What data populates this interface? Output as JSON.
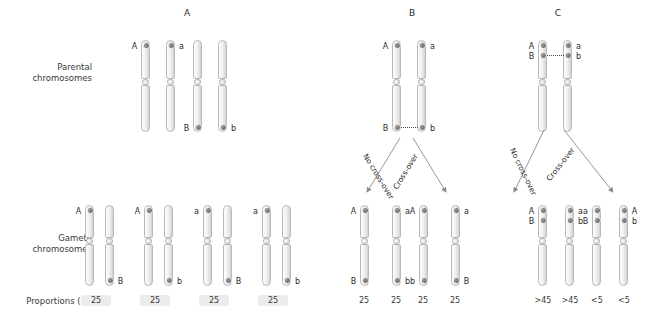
{
  "row_labels": {
    "parental_line1": "Parental",
    "parental_line2": "chromosomes",
    "gamete_line1": "Gamete",
    "gamete_line2": "chromosomes",
    "proportions": "Proportions (%)"
  },
  "arrow_labels": {
    "no_crossover": "No cross-over",
    "crossover": "Cross-over"
  },
  "panels": [
    {
      "id": "A",
      "title": "A",
      "parental": [
        {
          "top_label": "A",
          "top_side": "left",
          "bottom_label": "",
          "bottom_side": "",
          "top_dot": true,
          "bottom_dot": false
        },
        {
          "top_label": "a",
          "top_side": "right",
          "bottom_label": "",
          "bottom_side": "",
          "top_dot": true,
          "bottom_dot": false
        },
        {
          "top_label": "",
          "top_side": "",
          "bottom_label": "B",
          "bottom_side": "left",
          "top_dot": false,
          "bottom_dot": true
        },
        {
          "top_label": "",
          "top_side": "",
          "bottom_label": "b",
          "bottom_side": "right",
          "top_dot": false,
          "bottom_dot": true
        }
      ],
      "gametes": [
        {
          "proportion": "25",
          "banded": true,
          "chroms": [
            {
              "top_label": "A",
              "top_side": "left",
              "bottom_label": "",
              "bottom_side": "",
              "top_dot": true,
              "bottom_dot": false
            },
            {
              "top_label": "",
              "top_side": "",
              "bottom_label": "B",
              "bottom_side": "right",
              "top_dot": false,
              "bottom_dot": true
            }
          ]
        },
        {
          "proportion": "25",
          "banded": true,
          "chroms": [
            {
              "top_label": "A",
              "top_side": "left",
              "bottom_label": "",
              "bottom_side": "",
              "top_dot": true,
              "bottom_dot": false
            },
            {
              "top_label": "",
              "top_side": "",
              "bottom_label": "b",
              "bottom_side": "right",
              "top_dot": false,
              "bottom_dot": true
            }
          ]
        },
        {
          "proportion": "25",
          "banded": true,
          "chroms": [
            {
              "top_label": "a",
              "top_side": "left",
              "bottom_label": "",
              "bottom_side": "",
              "top_dot": true,
              "bottom_dot": false
            },
            {
              "top_label": "",
              "top_side": "",
              "bottom_label": "B",
              "bottom_side": "right",
              "top_dot": false,
              "bottom_dot": true
            }
          ]
        },
        {
          "proportion": "25",
          "banded": true,
          "chroms": [
            {
              "top_label": "a",
              "top_side": "left",
              "bottom_label": "",
              "bottom_side": "",
              "top_dot": true,
              "bottom_dot": false
            },
            {
              "top_label": "",
              "top_side": "",
              "bottom_label": "b",
              "bottom_side": "right",
              "top_dot": false,
              "bottom_dot": true
            }
          ]
        }
      ]
    },
    {
      "id": "B",
      "title": "B",
      "parental": [
        {
          "top_label": "A",
          "top_side": "left",
          "bottom_label": "B",
          "bottom_side": "left",
          "top_dot": true,
          "bottom_dot": true
        },
        {
          "top_label": "a",
          "top_side": "right",
          "bottom_label": "b",
          "bottom_side": "right",
          "top_dot": true,
          "bottom_dot": true
        }
      ],
      "gametes": [
        {
          "proportion": "25",
          "banded": false,
          "chroms": [
            {
              "top_label": "A",
              "top_side": "left",
              "bottom_label": "B",
              "bottom_side": "left",
              "top_dot": true,
              "bottom_dot": true
            },
            {
              "top_label": "a",
              "top_side": "right",
              "bottom_label": "b",
              "bottom_side": "right",
              "top_dot": true,
              "bottom_dot": true
            }
          ]
        },
        {
          "proportion": "25",
          "banded": false,
          "merged_with_prev": true,
          "chroms": []
        },
        {
          "proportion": "25",
          "banded": false,
          "chroms": [
            {
              "top_label": "A",
              "top_side": "left",
              "bottom_label": "b",
              "bottom_side": "left",
              "top_dot": true,
              "bottom_dot": true
            },
            {
              "top_label": "a",
              "top_side": "right",
              "bottom_label": "B",
              "bottom_side": "right",
              "top_dot": true,
              "bottom_dot": true
            }
          ]
        },
        {
          "proportion": "25",
          "banded": false,
          "merged_with_prev": true,
          "chroms": []
        }
      ]
    },
    {
      "id": "C",
      "title": "C",
      "parental": [
        {
          "top_label": "A",
          "top_side": "left",
          "mid_label": "B",
          "mid_side": "left",
          "top_dot": true,
          "mid_dot": true
        },
        {
          "top_label": "a",
          "top_side": "right",
          "mid_label": "b",
          "mid_side": "right",
          "top_dot": true,
          "mid_dot": true
        }
      ],
      "gametes": [
        {
          "proportion": ">45",
          "banded": false
        },
        {
          "proportion": ">45",
          "banded": false
        },
        {
          "proportion": "<5",
          "banded": false
        },
        {
          "proportion": "<5",
          "banded": false
        }
      ]
    }
  ]
}
